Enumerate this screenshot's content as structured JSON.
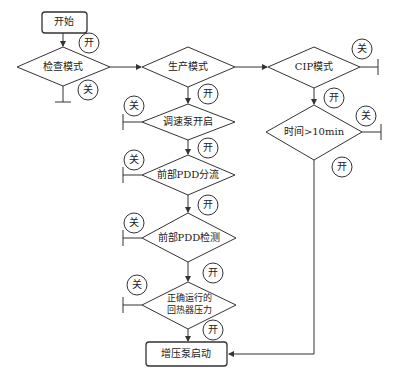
{
  "nodes": {
    "start": {
      "label": "开始"
    },
    "check_mode": {
      "label": "检查模式"
    },
    "production_mode": {
      "label": "生产模式"
    },
    "cip_mode": {
      "label": "CIP模式"
    },
    "time_check": {
      "label": "时间>10min"
    },
    "pump_on": {
      "label": "调速泵开启"
    },
    "pdd_divert": {
      "label": "前部PDD分流"
    },
    "pdd_detect": {
      "label": "前部PDD检测"
    },
    "pressure_line1": {
      "label": "正确运行的"
    },
    "pressure_line2": {
      "label": "回热器压力"
    },
    "booster_start": {
      "label": "增压泵启动"
    }
  },
  "conditions": {
    "on": "开",
    "off": "关"
  },
  "colors": {
    "stroke": "#333333",
    "background": "#ffffff"
  }
}
